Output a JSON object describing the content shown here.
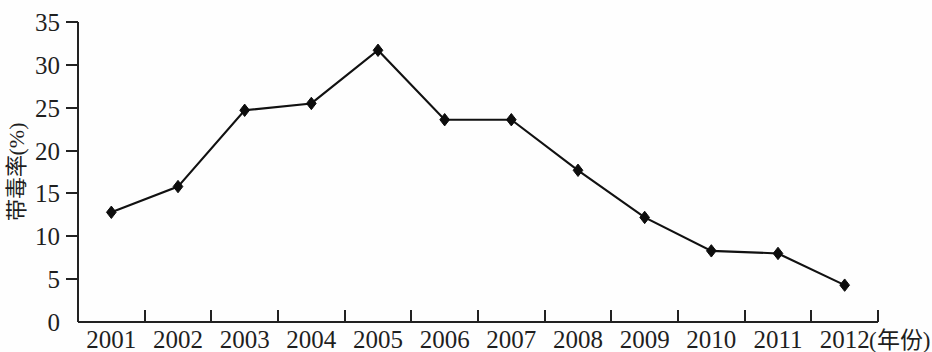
{
  "chart_data": {
    "type": "line",
    "title": "",
    "subtitle": "",
    "xlabel": "(年份)",
    "ylabel": "带毒率(%)",
    "categories": [
      "2001",
      "2002",
      "2003",
      "2004",
      "2005",
      "2006",
      "2007",
      "2008",
      "2009",
      "2010",
      "2011",
      "2012"
    ],
    "values": [
      12.8,
      15.8,
      24.7,
      25.5,
      31.7,
      23.6,
      23.6,
      17.7,
      12.2,
      8.3,
      8.0,
      4.3
    ],
    "series": [
      {
        "name": "带毒率",
        "values": [
          12.8,
          15.8,
          24.7,
          25.5,
          31.7,
          23.6,
          23.6,
          17.7,
          12.2,
          8.3,
          8.0,
          4.3
        ]
      }
    ],
    "ylim": [
      0,
      35
    ],
    "ytick_values": [
      0,
      5,
      10,
      15,
      20,
      25,
      30,
      35
    ],
    "ytick_labels": [
      "0",
      "5",
      "10",
      "15",
      "20",
      "25",
      "30",
      "35"
    ],
    "xtick_labels": [
      "2001",
      "2002",
      "2003",
      "2004",
      "2005",
      "2006",
      "2007",
      "2008",
      "2009",
      "2010",
      "2011",
      "2012"
    ],
    "grid": false,
    "legend": null,
    "legend_position": "none",
    "marker": "diamond",
    "line_color": "#111111",
    "marker_color": "#0d0d0d",
    "axis_color": "#222222",
    "background_color": "#fefefe",
    "annotations": []
  },
  "axis": {
    "y_title": "带毒率(%)",
    "x_unit_label": "(年份)"
  }
}
